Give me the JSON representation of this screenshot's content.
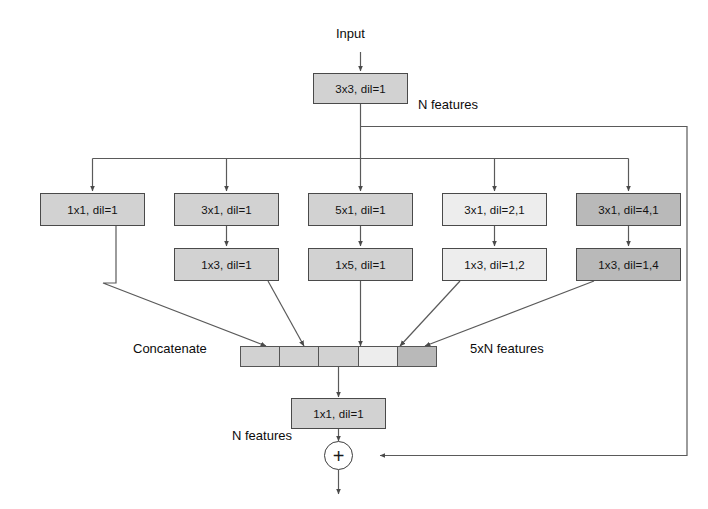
{
  "diagram": {
    "colors": {
      "stroke": "#4a4a4a",
      "wire": "#5a5a5a",
      "text": "#121212",
      "shade_mid": "#d2d2d2",
      "shade_light": "#ededed",
      "shade_dark": "#b9b9b9",
      "background": "#ffffff"
    },
    "labels": {
      "input": "Input",
      "n_features_top": "N features",
      "concatenate": "Concatenate",
      "five_n_features": "5xN features",
      "n_features_bottom": "N features",
      "add_symbol": "+"
    },
    "stem": {
      "label": "3x3, dil=1",
      "shade": "mid"
    },
    "branches": [
      {
        "id": "branch-1",
        "first": "1x1, dil=1",
        "first_shade": "mid",
        "second": null,
        "second_shade": null
      },
      {
        "id": "branch-2",
        "first": "3x1, dil=1",
        "first_shade": "mid",
        "second": "1x3, dil=1",
        "second_shade": "mid"
      },
      {
        "id": "branch-3",
        "first": "5x1, dil=1",
        "first_shade": "mid",
        "second": "1x5, dil=1",
        "second_shade": "mid"
      },
      {
        "id": "branch-4",
        "first": "3x1, dil=2,1",
        "first_shade": "light",
        "second": "1x3, dil=1,2",
        "second_shade": "light"
      },
      {
        "id": "branch-5",
        "first": "3x1, dil=4,1",
        "first_shade": "dark",
        "second": "1x3, dil=1,4",
        "second_shade": "dark"
      }
    ],
    "concat": {
      "segments": [
        "mid",
        "mid",
        "mid",
        "light",
        "dark"
      ],
      "segment_count": 5
    },
    "projection": {
      "label": "1x1, dil=1",
      "shade": "mid"
    }
  }
}
